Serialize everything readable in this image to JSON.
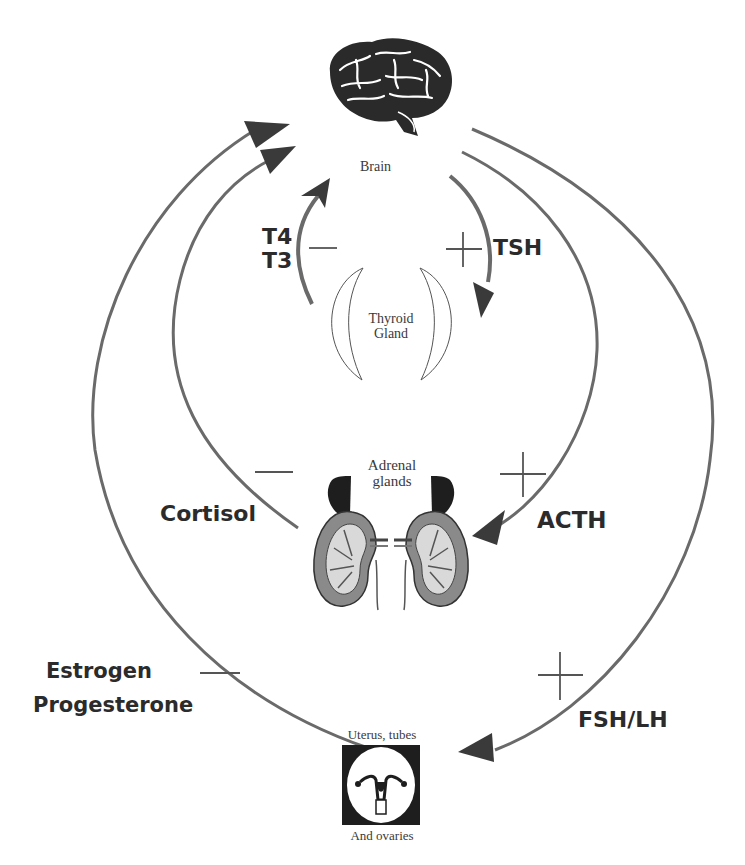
{
  "diagram": {
    "type": "endocrine feedback loop",
    "colors": {
      "line": "#6a6a6a",
      "arrow": "#3a3a3a",
      "text": "#2b2b2b",
      "organ_dark": "#1e1e1e",
      "background": "#ffffff"
    }
  },
  "nodes": {
    "brain": {
      "label": "Brain",
      "icon": "brain-icon"
    },
    "thyroid": {
      "label_line1": "Thyroid",
      "label_line2": "Gland",
      "icon": "thyroid-icon"
    },
    "adrenal": {
      "label_line1": "Adrenal",
      "label_line2": "glands",
      "icon": "kidney-adrenal-icon"
    },
    "uterus": {
      "label_top": "Uterus, tubes",
      "label_bottom": "And ovaries",
      "icon": "uterus-icon"
    }
  },
  "hormones": {
    "t4": "T4",
    "t3": "T3",
    "tsh": "TSH",
    "cortisol": "Cortisol",
    "acth": "ACTH",
    "estrogen": "Estrogen",
    "progesterone": "Progesterone",
    "fsh_lh": "FSH/LH"
  },
  "signs": {
    "thyroid_feedback": "−",
    "tsh_stimulation": "+",
    "cortisol_feedback": "−",
    "acth_stimulation": "+",
    "sex_hormone_feedback": "−",
    "fsh_lh_stimulation": "+"
  }
}
